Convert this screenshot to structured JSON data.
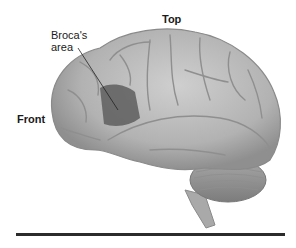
{
  "diagram": {
    "labels": {
      "top": "Top",
      "front": "Front",
      "broca_line1": "Broca's",
      "broca_line2": "area"
    },
    "colors": {
      "brain": "#b8b8b8",
      "brain_shadow": "#8c8c8c",
      "broca_region": "#5e5e5e",
      "rule": "#2b2b2b"
    }
  }
}
